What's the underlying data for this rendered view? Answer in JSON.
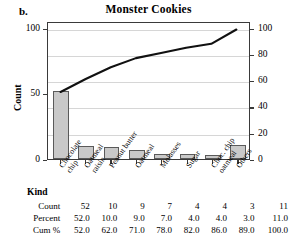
{
  "panel": {
    "label": "b."
  },
  "chart_data": {
    "type": "bar",
    "title": "Monster Cookies",
    "xlabel": "Kind",
    "ylabel": "Count",
    "categories": [
      "Chocolate chip",
      "Oatmeal raisin",
      "Peanut butter",
      "Oatmeal",
      "Molasses",
      "Sugar",
      "Choc. chip oatmeal",
      "Others"
    ],
    "category_lines": [
      [
        "Chocolate",
        "chip"
      ],
      [
        "Oatmeal",
        "raisin"
      ],
      [
        "Peanut butter"
      ],
      [
        "Oatmeal"
      ],
      [
        "Molasses"
      ],
      [
        "Sugar"
      ],
      [
        "Choc. chip",
        "oatmeal"
      ],
      [
        "Others"
      ]
    ],
    "values": [
      52,
      10,
      9,
      7,
      4,
      4,
      3,
      11
    ],
    "series": [
      {
        "name": "Count",
        "values": [
          52,
          10,
          9,
          7,
          4,
          4,
          3,
          11
        ]
      },
      {
        "name": "Cum %",
        "values": [
          52.0,
          62.0,
          71.0,
          78.0,
          82.0,
          86.0,
          89.0,
          100.0
        ]
      }
    ],
    "ylim": [
      0,
      105
    ],
    "yticks": [
      0,
      50,
      100
    ],
    "ylim_right": [
      0,
      105
    ],
    "yticks_right": [
      0,
      20,
      40,
      60,
      80,
      100
    ],
    "ylabel_right": "",
    "grid": true,
    "legend": "none",
    "bar_color": "#c9c9c9",
    "bar_border_color": "#5a5a5a",
    "line_color": "#111111",
    "grid_color": "#d6d6d6",
    "axis_color": "#3a3a3a"
  },
  "table": {
    "kind_label": "Kind",
    "rows": [
      {
        "label": "Count",
        "values": [
          "52",
          "10",
          "9",
          "7",
          "4",
          "4",
          "3",
          "11"
        ]
      },
      {
        "label": "Percent",
        "values": [
          "52.0",
          "10.0",
          "9.0",
          "7.0",
          "4.0",
          "4.0",
          "3.0",
          "11.0"
        ]
      },
      {
        "label": "Cum %",
        "values": [
          "52.0",
          "62.0",
          "71.0",
          "78.0",
          "82.0",
          "86.0",
          "89.0",
          "100.0"
        ]
      }
    ]
  }
}
